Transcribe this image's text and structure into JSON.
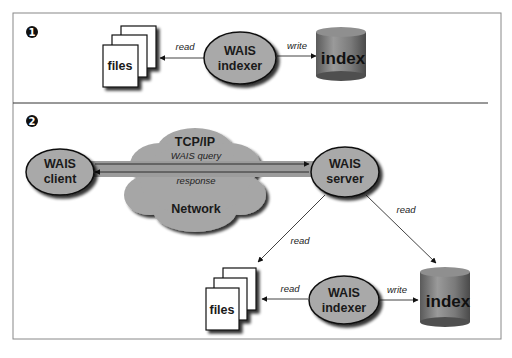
{
  "diagram": {
    "type": "WAIS architecture",
    "panels": [
      {
        "number": "1",
        "nodes": {
          "files": "files",
          "indexer_line1": "WAIS",
          "indexer_line2": "indexer",
          "index": "index"
        },
        "edges": {
          "indexer_to_files": "read",
          "indexer_to_index": "write"
        }
      },
      {
        "number": "2",
        "nodes": {
          "client_line1": "WAIS",
          "client_line2": "client",
          "cloud_top": "TCP/IP",
          "cloud_bottom": "Network",
          "server_line1": "WAIS",
          "server_line2": "server",
          "files": "files",
          "indexer_line1": "WAIS",
          "indexer_line2": "indexer",
          "index": "index"
        },
        "edges": {
          "query": "WAIS query",
          "response": "response",
          "server_to_files": "read",
          "server_to_index": "read",
          "indexer_to_files": "read",
          "indexer_to_index": "write"
        }
      }
    ],
    "colors": {
      "node_fill": "#a9a9a9",
      "cloud_fill": "#a6a6a6",
      "index_fill": "#7a7a7a",
      "outline": "#111111",
      "frame": "#888888"
    }
  }
}
